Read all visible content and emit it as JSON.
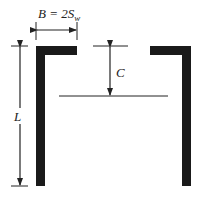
{
  "diagram": {
    "labels": {
      "width": "B = 2S",
      "width_sub": "w",
      "length": "L",
      "clearance": "C"
    },
    "colors": {
      "wall": "#1a1a1a",
      "line": "#222222",
      "background": "#ffffff"
    }
  }
}
